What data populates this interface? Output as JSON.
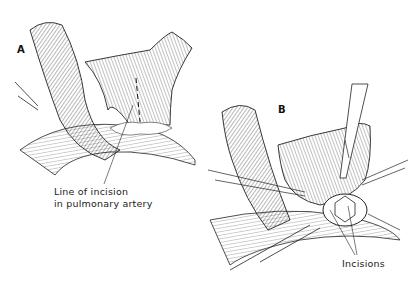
{
  "figure": {
    "panels": [
      {
        "id": "A",
        "letter": "A",
        "callouts": [
          {
            "line1": "Line of incision",
            "line2": "in pulmonary artery"
          }
        ]
      },
      {
        "id": "B",
        "letter": "B",
        "callouts": [
          {
            "line1": "Incisions"
          }
        ]
      }
    ],
    "colors": {
      "ink": "#1a1a1a",
      "background": "#ffffff"
    }
  }
}
